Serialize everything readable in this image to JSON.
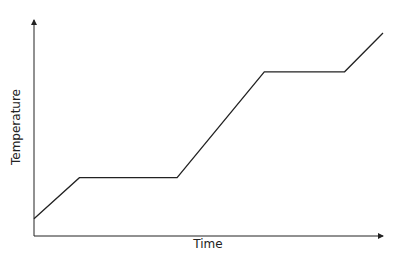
{
  "chart_data": {
    "type": "line",
    "title": "",
    "xlabel": "Time",
    "ylabel": "Temperature",
    "grid": false,
    "legend": null,
    "x_ticks": [],
    "y_ticks": [],
    "series": [
      {
        "name": "Temperature",
        "points": [
          {
            "x": 0,
            "y": 0.08
          },
          {
            "x": 0.13,
            "y": 0.27
          },
          {
            "x": 0.41,
            "y": 0.27
          },
          {
            "x": 0.66,
            "y": 0.76
          },
          {
            "x": 0.89,
            "y": 0.76
          },
          {
            "x": 1.0,
            "y": 0.94
          }
        ]
      }
    ],
    "xlim": [
      0,
      1
    ],
    "ylim": [
      0,
      1
    ],
    "line_color": "#222222"
  }
}
